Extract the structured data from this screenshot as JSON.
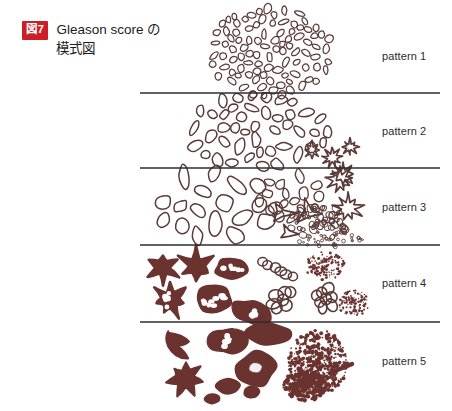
{
  "figure": {
    "badge_label": "図7",
    "badge_color": "#cc2026",
    "caption_line_1": "Gleason score の",
    "caption_line_2": "模式図",
    "caption_full": "Gleason score の模式図"
  },
  "style": {
    "outline_color": "#5a3a38",
    "fill_color": "#6b3330",
    "divider_color": "#2e2e2e",
    "label_color": "#2b2b2b",
    "background": "#ffffff"
  },
  "diagram": {
    "band_x_start": 140,
    "band_x_end": 440,
    "dividers_y": [
      93,
      168,
      245,
      322
    ],
    "label_x": 382
  },
  "chart_data": {
    "type": "diagram",
    "bands": [
      {
        "label": "pattern 1",
        "label_y": 57,
        "y_top": 8,
        "y_bottom": 93,
        "gland_style": "small uniform closely packed round-to-oval glands forming a circumscribed nodule",
        "seed": 11,
        "shapes": [
          {
            "kind": "oval-cluster",
            "cx": 270,
            "cy": 52,
            "rx": 62,
            "ry": 44,
            "count": 96,
            "glen": 9.5,
            "gwid": 6.2,
            "fill": false,
            "stroke_w": 1.25,
            "jitter": 0.9
          }
        ]
      },
      {
        "label": "pattern 2",
        "label_y": 132,
        "y_top": 93,
        "y_bottom": 168,
        "gland_style": "larger, more variable, more loosely separated glands with a few early cribriform forms at the margin",
        "seed": 22,
        "shapes": [
          {
            "kind": "oval-cluster",
            "cx": 258,
            "cy": 131,
            "rx": 70,
            "ry": 37,
            "count": 58,
            "glen": 13.5,
            "gwid": 8.0,
            "fill": false,
            "stroke_w": 1.45,
            "jitter": 1.0
          },
          {
            "kind": "cribriform",
            "cx": 312,
            "cy": 150,
            "r": 8.5,
            "lobes": 8
          },
          {
            "kind": "cribriform",
            "cx": 332,
            "cy": 158,
            "r": 9.5,
            "lobes": 9
          },
          {
            "kind": "cribriform",
            "cx": 350,
            "cy": 147,
            "r": 8.0,
            "lobes": 8
          }
        ]
      },
      {
        "label": "pattern 3",
        "label_y": 208,
        "y_top": 168,
        "y_bottom": 245,
        "gland_style": "markedly variable gland size and shape, infiltrating small glands, angular forms and tiny dispersed glands",
        "seed": 33,
        "shapes": [
          {
            "kind": "oval-cluster",
            "cx": 215,
            "cy": 205,
            "rx": 62,
            "ry": 33,
            "count": 30,
            "glen": 17.0,
            "gwid": 11.0,
            "fill": false,
            "stroke_w": 1.5,
            "jitter": 1.15
          },
          {
            "kind": "oval-cluster",
            "cx": 290,
            "cy": 196,
            "rx": 32,
            "ry": 22,
            "count": 16,
            "glen": 12.0,
            "gwid": 8.0,
            "fill": false,
            "stroke_w": 1.35,
            "jitter": 1.0
          },
          {
            "kind": "angular",
            "cx": 282,
            "cy": 213,
            "r": 13
          },
          {
            "kind": "angular",
            "cx": 308,
            "cy": 212,
            "r": 14
          },
          {
            "kind": "angular",
            "cx": 288,
            "cy": 233,
            "r": 10
          },
          {
            "kind": "micro-cluster",
            "cx": 318,
            "cy": 222,
            "rx": 30,
            "ry": 18,
            "count": 52,
            "rmin": 1.6,
            "rmax": 4.4
          },
          {
            "kind": "micro-spray",
            "cx": 330,
            "cy": 239,
            "rx": 34,
            "ry": 8,
            "count": 40,
            "rmin": 0.8,
            "rmax": 2.0
          },
          {
            "kind": "cribriform",
            "cx": 340,
            "cy": 180,
            "r": 13.5,
            "lobes": 9
          },
          {
            "kind": "cribriform",
            "cx": 348,
            "cy": 208,
            "r": 14.0,
            "lobes": 9
          },
          {
            "kind": "cribriform",
            "cx": 343,
            "cy": 174,
            "r": 11.0,
            "lobes": 8
          }
        ]
      },
      {
        "label": "pattern 4",
        "label_y": 284,
        "y_top": 245,
        "y_bottom": 322,
        "gland_style": "fused and cribriform glandular masses, ragged infiltrating sheets, hypernephroid and glomeruloid clusters",
        "seed": 44,
        "shapes": [
          {
            "kind": "star-blob",
            "cx": 163,
            "cy": 268,
            "r": 16,
            "points": 6,
            "fill": true
          },
          {
            "kind": "star-blob",
            "cx": 196,
            "cy": 266,
            "r": 17,
            "points": 6,
            "fill": true
          },
          {
            "kind": "perforated",
            "cx": 232,
            "cy": 269,
            "rx": 17,
            "ry": 11,
            "holes": 6,
            "fill": true
          },
          {
            "kind": "bead-chain",
            "x1": 262,
            "y1": 262,
            "x2": 293,
            "y2": 276,
            "count": 6,
            "r": 5.2
          },
          {
            "kind": "dot-swarm",
            "cx": 325,
            "cy": 266,
            "rx": 20,
            "ry": 14,
            "count": 150,
            "rmin": 0.5,
            "rmax": 1.5
          },
          {
            "kind": "star-blob",
            "cx": 170,
            "cy": 300,
            "r": 17,
            "points": 7,
            "fill": true,
            "holes": 5
          },
          {
            "kind": "perforated",
            "cx": 214,
            "cy": 300,
            "rx": 19,
            "ry": 13,
            "holes": 8,
            "fill": true
          },
          {
            "kind": "perforated",
            "cx": 252,
            "cy": 313,
            "rx": 20,
            "ry": 11,
            "holes": 4,
            "fill": true,
            "rot": 25
          },
          {
            "kind": "grape",
            "cx": 283,
            "cy": 300,
            "r": 16,
            "count": 7,
            "br": 6.2
          },
          {
            "kind": "grape",
            "cx": 326,
            "cy": 299,
            "r": 15,
            "count": 8,
            "br": 5.6
          },
          {
            "kind": "dot-swarm",
            "cx": 353,
            "cy": 303,
            "rx": 16,
            "ry": 13,
            "count": 120,
            "rmin": 0.5,
            "rmax": 1.4
          }
        ]
      },
      {
        "label": "pattern 5",
        "label_y": 362,
        "y_top": 322,
        "y_bottom": 403,
        "gland_style": "solid undifferentiated sheets and cords of tumour with comedonecrosis and single infiltrating cells",
        "seed": 55,
        "shapes": [
          {
            "kind": "solid-blob",
            "cx": 181,
            "cy": 344,
            "r": 16,
            "fill": true,
            "variant": "claw"
          },
          {
            "kind": "perforated",
            "cx": 228,
            "cy": 341,
            "rx": 18,
            "ry": 13,
            "holes": 7,
            "fill": true
          },
          {
            "kind": "solid-blob",
            "cx": 268,
            "cy": 334,
            "r": 17,
            "fill": true,
            "variant": "slab"
          },
          {
            "kind": "ring-blob",
            "cx": 256,
            "cy": 369,
            "rx": 19,
            "ry": 16
          },
          {
            "kind": "solid-blob",
            "cx": 186,
            "cy": 378,
            "r": 19,
            "fill": true,
            "variant": "ragged"
          },
          {
            "kind": "solid-blob",
            "cx": 228,
            "cy": 387,
            "r": 11,
            "fill": true,
            "variant": "oval"
          },
          {
            "kind": "solid-blob",
            "cx": 252,
            "cy": 392,
            "r": 8,
            "fill": true,
            "variant": "oval"
          },
          {
            "kind": "solid-blob",
            "cx": 212,
            "cy": 399,
            "r": 7,
            "fill": true,
            "variant": "oval"
          },
          {
            "kind": "dot-swarm",
            "cx": 318,
            "cy": 362,
            "rx": 30,
            "ry": 32,
            "count": 560,
            "rmin": 0.6,
            "rmax": 2.0
          },
          {
            "kind": "dot-swarm",
            "cx": 305,
            "cy": 385,
            "rx": 22,
            "ry": 16,
            "count": 300,
            "rmin": 0.7,
            "rmax": 2.3
          },
          {
            "kind": "streak",
            "x1": 330,
            "y1": 373,
            "x2": 352,
            "y2": 364,
            "w": 4.5
          }
        ]
      }
    ]
  }
}
